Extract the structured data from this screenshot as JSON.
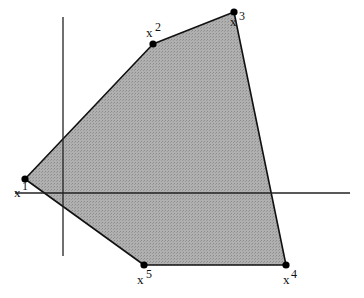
{
  "diagram": {
    "type": "convex-polygon-with-axes",
    "colors": {
      "fill": "#a8a8a8",
      "stroke": "#111111",
      "axis": "#222222",
      "background": "#ffffff"
    },
    "axes": {
      "vertical": {
        "x": 63,
        "y1": 17,
        "y2": 256
      },
      "horizontal": {
        "y": 193,
        "x1": 15,
        "x2": 350
      }
    },
    "vertices": [
      {
        "id": "x1",
        "base": "x",
        "sup": "1",
        "x": 25,
        "y": 179
      },
      {
        "id": "x2",
        "base": "x",
        "sup": "2",
        "x": 153,
        "y": 44
      },
      {
        "id": "x3",
        "base": "x",
        "sup": "3",
        "x": 234,
        "y": 12
      },
      {
        "id": "x4",
        "base": "x",
        "sup": "4",
        "x": 286,
        "y": 265
      },
      {
        "id": "x5",
        "base": "x",
        "sup": "5",
        "x": 144,
        "y": 265
      }
    ],
    "labels": {
      "x1": {
        "base": "x",
        "sup": "1"
      },
      "x2": {
        "base": "x",
        "sup": "2"
      },
      "x3": {
        "base": "x",
        "sup": "3"
      },
      "x4": {
        "base": "x",
        "sup": "4"
      },
      "x5": {
        "base": "x",
        "sup": "5"
      }
    }
  }
}
